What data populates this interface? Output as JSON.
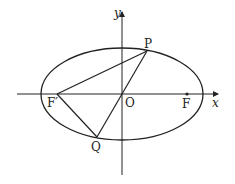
{
  "diagram": {
    "type": "ellipse-focal-triangle",
    "colors": {
      "stroke": "#222222",
      "background": "#ffffff"
    },
    "axes": {
      "x_label": "x",
      "y_label": "y"
    },
    "points": {
      "origin": "O",
      "right_focus": "F",
      "left_focus": "F′",
      "point_on_ellipse_upper": "P",
      "point_on_ellipse_lower": "Q"
    },
    "segments": [
      "F′P",
      "PQ",
      "F′Q"
    ]
  }
}
